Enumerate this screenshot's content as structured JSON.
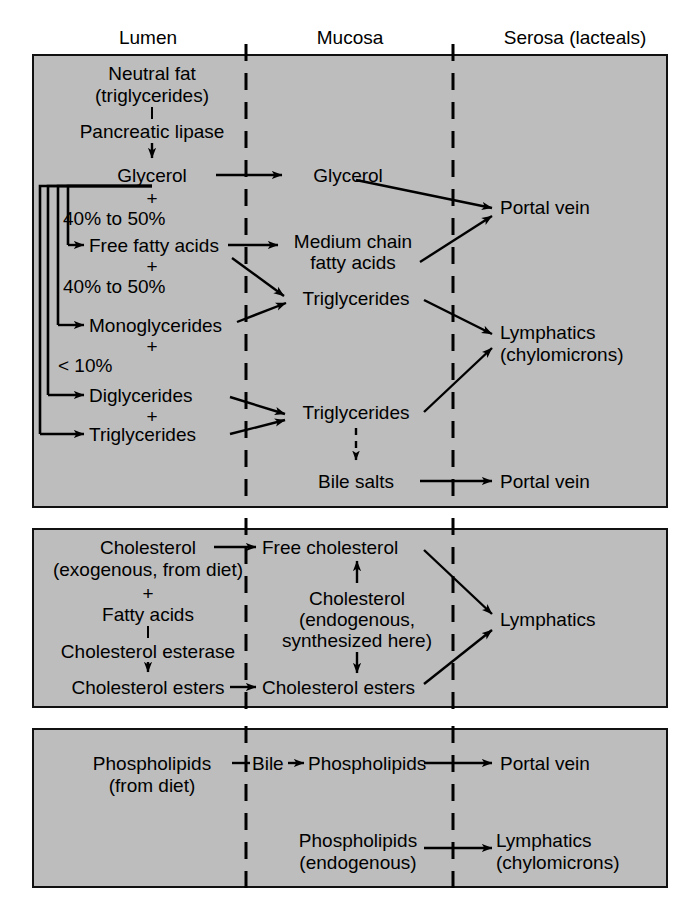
{
  "figure": {
    "title_absent": true,
    "background_color": "#bdbdbd",
    "line_color": "#000000"
  },
  "column_headers": [
    {
      "id": "lumen",
      "label": "Lumen"
    },
    {
      "id": "mucosa",
      "label": "Mucosa"
    },
    {
      "id": "serosa",
      "label": "Serosa (lacteals)"
    }
  ],
  "panels": [
    {
      "id": "panel-fat",
      "name": "neutral-fat-digestion",
      "nodes": {
        "neutral_fat": "Neutral fat",
        "neutral_fat_sub": "(triglycerides)",
        "pancreatic_lipase": "Pancreatic lipase",
        "glycerol_lumen": "Glycerol",
        "pct_fatty_acids": "40% to 50%",
        "free_fatty_acids": "Free fatty acids",
        "pct_monoglycerides": "40% to 50%",
        "monoglycerides": "Monoglycerides",
        "pct_small": "< 10%",
        "diglycerides": "Diglycerides",
        "triglycerides_lumen": "Triglycerides",
        "glycerol_mucosa": "Glycerol",
        "medium_chain_1": "Medium chain",
        "medium_chain_2": "fatty acids",
        "triglycerides_mucosa_1": "Triglycerides",
        "triglycerides_mucosa_2": "Triglycerides",
        "bile_salts": "Bile salts",
        "portal_vein_1": "Portal vein",
        "portal_vein_2": "Portal vein",
        "lymphatics_1": "Lymphatics",
        "lymphatics_1_sub": "(chylomicrons)"
      },
      "plus_signs": [
        "+",
        "+",
        "+",
        "+"
      ]
    },
    {
      "id": "panel-cholesterol",
      "name": "cholesterol-absorption",
      "nodes": {
        "cholesterol": "Cholesterol",
        "cholesterol_sub": "(exogenous, from diet)",
        "fatty_acids": "Fatty acids",
        "cholesterol_esterase": "Cholesterol esterase",
        "cholesterol_esters_lumen": "Cholesterol esters",
        "free_cholesterol": "Free cholesterol",
        "cholesterol_endo_1": "Cholesterol",
        "cholesterol_endo_2": "(endogenous,",
        "cholesterol_endo_3": "synthesized here)",
        "cholesterol_esters_mucosa": "Cholesterol esters",
        "lymphatics": "Lymphatics"
      },
      "plus_signs": [
        "+"
      ]
    },
    {
      "id": "panel-phospholipid",
      "name": "phospholipid-absorption",
      "nodes": {
        "phospholipids_diet": "Phospholipids",
        "phospholipids_diet_sub": "(from diet)",
        "bile_label": "Bile",
        "phospholipids_mucosa": "Phospholipids",
        "portal_vein": "Portal vein",
        "phospholipids_endo": "Phospholipids",
        "phospholipids_endo_sub": "(endogenous)",
        "lymphatics": "Lymphatics",
        "lymphatics_sub": "(chylomicrons)"
      }
    }
  ]
}
